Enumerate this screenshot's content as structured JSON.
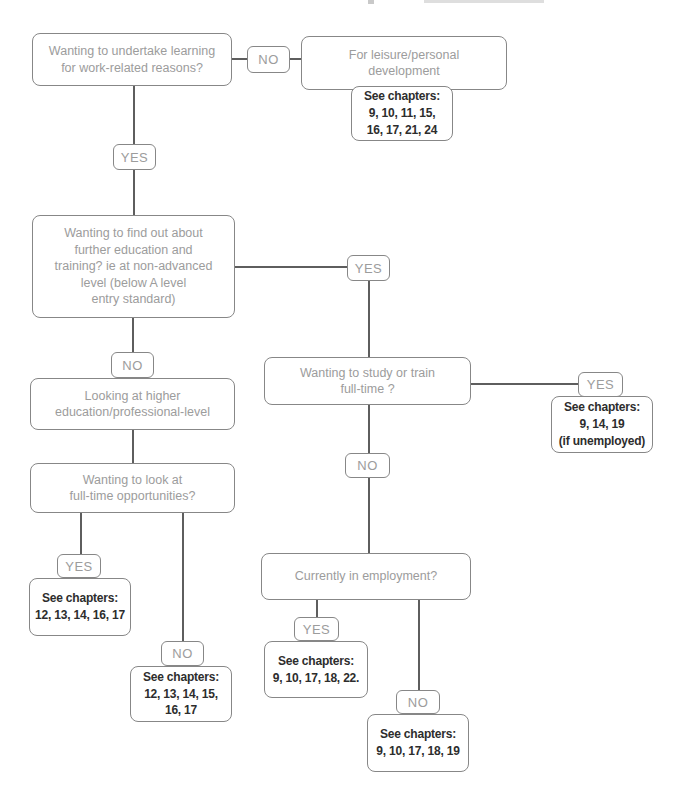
{
  "colors": {
    "background": "#ffffff",
    "box_border": "#878787",
    "question_text": "#9c9c9c",
    "chapters_text": "#2d2d2d",
    "connector": "#5e5e5e"
  },
  "flowchart": {
    "q_work_learning": {
      "text": "Wanting to undertake learning\nfor work-related reasons?"
    },
    "no_top": {
      "text": "NO"
    },
    "leisure": {
      "text": "For leisure/personal\ndevelopment"
    },
    "leisure_chapters": {
      "text": "See chapters:\n9, 10, 11, 15,\n16, 17, 21, 24"
    },
    "yes_top": {
      "text": "YES"
    },
    "q_further_education": {
      "text": "Wanting to find out about\nfurther education and\ntraining? ie at non-advanced\nlevel (below A level\nentry standard)"
    },
    "yes_further_education": {
      "text": "YES"
    },
    "q_study_fulltime": {
      "text": "Wanting to study or train\nfull-time ?"
    },
    "yes_study": {
      "text": "YES"
    },
    "yes_study_chapters": {
      "text": "See chapters:\n9, 14, 19\n(if unemployed)"
    },
    "no_study": {
      "text": "NO"
    },
    "q_employment": {
      "text": "Currently in employment?"
    },
    "yes_employment": {
      "text": "YES"
    },
    "yes_employment_chapters": {
      "text": "See chapters:\n9, 10, 17, 18, 22."
    },
    "no_employment": {
      "text": "NO"
    },
    "no_employment_chapters": {
      "text": "See chapters:\n9, 10, 17, 18, 19"
    },
    "no_further_education": {
      "text": "NO"
    },
    "q_higher_education": {
      "text": "Looking at higher\neducation/professional-level"
    },
    "q_fulltime_opportunities": {
      "text": "Wanting to look at\nfull-time opportunities?"
    },
    "yes_fulltime": {
      "text": "YES"
    },
    "yes_fulltime_chapters": {
      "text": "See chapters:\n12, 13, 14, 16, 17"
    },
    "no_fulltime": {
      "text": "NO"
    },
    "no_fulltime_chapters": {
      "text": "See chapters:\n12, 13, 14, 15,\n16, 17"
    }
  }
}
